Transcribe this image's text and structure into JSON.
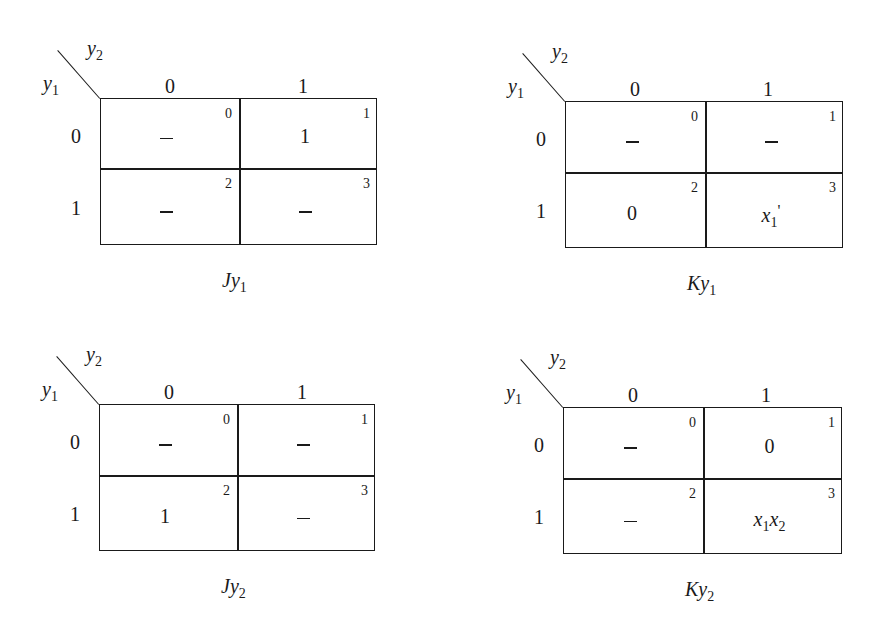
{
  "figure": {
    "maps": [
      {
        "id": "Jy1",
        "caption": {
          "main": "Jy",
          "sub": "1"
        },
        "row_var": {
          "main": "y",
          "sub": "1"
        },
        "col_var": {
          "main": "y",
          "sub": "2"
        },
        "col_labels": [
          "0",
          "1"
        ],
        "row_labels": [
          "0",
          "1"
        ],
        "cells": [
          {
            "index": "0",
            "value": "–",
            "dash": true
          },
          {
            "index": "1",
            "value": "1",
            "dash": false
          },
          {
            "index": "2",
            "value": "–",
            "dash": true
          },
          {
            "index": "3",
            "value": "–",
            "dash": true
          }
        ]
      },
      {
        "id": "Ky1",
        "caption": {
          "main": "Ky",
          "sub": "1"
        },
        "row_var": {
          "main": "y",
          "sub": "1"
        },
        "col_var": {
          "main": "y",
          "sub": "2"
        },
        "col_labels": [
          "0",
          "1"
        ],
        "row_labels": [
          "0",
          "1"
        ],
        "cells": [
          {
            "index": "0",
            "value": "–",
            "dash": true
          },
          {
            "index": "1",
            "value": "–",
            "dash": true
          },
          {
            "index": "2",
            "value": "0",
            "dash": false
          },
          {
            "index": "3",
            "value": "x1'",
            "dash": false
          }
        ]
      },
      {
        "id": "Jy2",
        "caption": {
          "main": "Jy",
          "sub": "2"
        },
        "row_var": {
          "main": "y",
          "sub": "1"
        },
        "col_var": {
          "main": "y",
          "sub": "2"
        },
        "col_labels": [
          "0",
          "1"
        ],
        "row_labels": [
          "0",
          "1"
        ],
        "cells": [
          {
            "index": "0",
            "value": "–",
            "dash": true
          },
          {
            "index": "1",
            "value": "–",
            "dash": true
          },
          {
            "index": "2",
            "value": "1",
            "dash": false
          },
          {
            "index": "3",
            "value": "–",
            "dash": true
          }
        ]
      },
      {
        "id": "Ky2",
        "caption": {
          "main": "Ky",
          "sub": "2"
        },
        "row_var": {
          "main": "y",
          "sub": "1"
        },
        "col_var": {
          "main": "y",
          "sub": "2"
        },
        "col_labels": [
          "0",
          "1"
        ],
        "row_labels": [
          "0",
          "1"
        ],
        "cells": [
          {
            "index": "0",
            "value": "–",
            "dash": true
          },
          {
            "index": "1",
            "value": "0",
            "dash": false
          },
          {
            "index": "2",
            "value": "–",
            "dash": true
          },
          {
            "index": "3",
            "value": "x1x2",
            "dash": false
          }
        ]
      }
    ],
    "special_terms": {
      "x1_prime": {
        "main": "x",
        "sub": "1",
        "suffix": "'"
      },
      "x1x2": {
        "a": "x",
        "a_sub": "1",
        "b": "x",
        "b_sub": "2"
      }
    }
  }
}
